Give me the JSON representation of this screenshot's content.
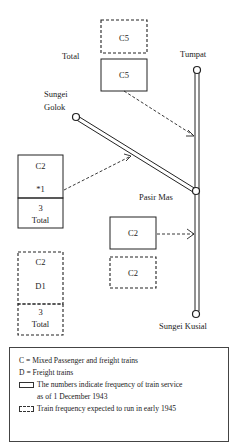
{
  "diagram": {
    "stations": [
      {
        "name_lines": [
          "Tumpat"
        ],
        "x": 197,
        "y": 70
      },
      {
        "name_lines": [
          "Sungei",
          "Golok"
        ],
        "x": 76,
        "y": 117
      },
      {
        "name_lines": [
          "Pasir Mas"
        ],
        "x": 196,
        "y": 191
      },
      {
        "name_lines": [
          "Sungei Kusial"
        ],
        "x": 196,
        "y": 314
      }
    ],
    "labels": {
      "tumpat": "Tumpat",
      "sungei": "Sungei",
      "golok": "Golok",
      "pasir_mas": "Pasir Mas",
      "sungei_kusial": "Sungei Kusial",
      "top_total": "Total"
    },
    "boxes": {
      "top_dashed": {
        "text": "C5",
        "style": "dashed"
      },
      "top_solid": {
        "text": "C5",
        "style": "solid"
      },
      "left_solid": {
        "line1": "C2",
        "line2": "*1",
        "total_num": "3",
        "total_label": "Total",
        "style": "solid"
      },
      "left_dashed": {
        "line1": "C2",
        "line2": "D1",
        "total_num": "3",
        "total_label": "Total",
        "style": "dashed"
      },
      "mid_solid": {
        "text": "C2",
        "style": "solid"
      },
      "mid_dashed": {
        "text": "C2",
        "style": "dashed"
      }
    }
  },
  "legend": {
    "items": [
      "C = Mixed Passenger and freight trains",
      "D = Freight trains",
      "The numbers indicate frequency of train service",
      "as of 1 December 1943",
      "Train frequency expected to run in early 1945"
    ]
  }
}
